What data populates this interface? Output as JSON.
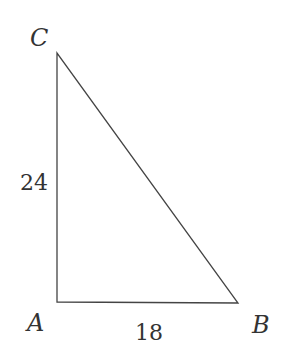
{
  "diagram": {
    "type": "right-triangle",
    "vertices": {
      "A": {
        "label": "A",
        "x": 57,
        "y": 302
      },
      "B": {
        "label": "B",
        "x": 238,
        "y": 303
      },
      "C": {
        "label": "C",
        "x": 57,
        "y": 53
      }
    },
    "sides": {
      "AC": {
        "label": "24"
      },
      "AB": {
        "label": "18"
      }
    },
    "colors": {
      "stroke": "#444444",
      "text": "#333333",
      "background": "#ffffff"
    }
  }
}
